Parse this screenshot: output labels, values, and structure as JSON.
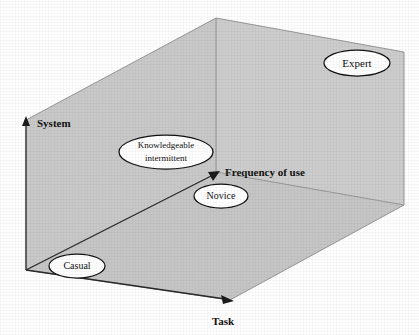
{
  "diagram": {
    "type": "3d-axes-scatter",
    "background_color": "#ffffff",
    "wall_color": "#c9c9c9",
    "floor_color": "#c6c6c6",
    "axis_color": "#1c1c1c",
    "node_fill": "#ffffff",
    "node_stroke": "#111111",
    "axes": [
      {
        "id": "system",
        "label": "System",
        "orientation": "vertical",
        "label_x": 37,
        "label_y": 127,
        "arrow": "up"
      },
      {
        "id": "task",
        "label": "Task",
        "orientation": "horizontal-right",
        "label_x": 212,
        "label_y": 325,
        "arrow": "right"
      },
      {
        "id": "frequency",
        "label": "Frequency of use",
        "orientation": "depth-diagonal",
        "label_x": 225,
        "label_y": 175,
        "arrow": "up-left-depth"
      }
    ],
    "nodes": [
      {
        "id": "expert",
        "label": "Expert",
        "cx": 357,
        "cy": 63,
        "rx": 33,
        "ry": 13,
        "font_size": 11,
        "lines": [
          "Expert"
        ]
      },
      {
        "id": "knowledgeable-intermittent",
        "label": "Knowledgeable intermittent",
        "cx": 166,
        "cy": 152,
        "rx": 47,
        "ry": 17,
        "font_size": 9,
        "lines": [
          "Knowledgeable",
          "intermittent"
        ]
      },
      {
        "id": "novice",
        "label": "Novice",
        "cx": 221,
        "cy": 196,
        "rx": 27,
        "ry": 12,
        "font_size": 10,
        "lines": [
          "Novice"
        ]
      },
      {
        "id": "casual",
        "label": "Casual",
        "cx": 77,
        "cy": 266,
        "rx": 28,
        "ry": 12,
        "font_size": 10,
        "lines": [
          "Casual"
        ]
      }
    ]
  }
}
